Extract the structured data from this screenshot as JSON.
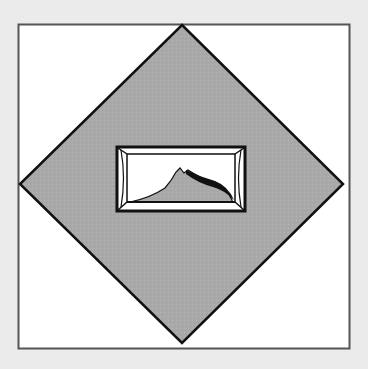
{
  "figure": {
    "background_color": "#ebebeb",
    "frame": {
      "x": 18,
      "y": 24,
      "width": 332,
      "height": 325,
      "fill": "#ffffff",
      "stroke": "#555555"
    },
    "diamond": {
      "points": "182,25 343,184 182,343 20,184",
      "fill": "#a9a9a9",
      "stroke": "#111111"
    },
    "picture_icon": {
      "x": 117,
      "y": 147,
      "width": 128,
      "height": 64,
      "fill": "#ffffff",
      "stroke": "#111111",
      "mountain_fill": "#a9a9a9"
    }
  }
}
